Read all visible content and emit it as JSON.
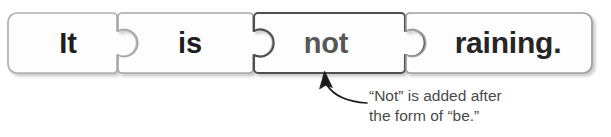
{
  "diagram": {
    "type": "jigsaw-sentence-breakdown",
    "sentence": "It is not raining.",
    "pieces": [
      {
        "id": "piece-it",
        "label": "It",
        "highlighted": false,
        "text_color": "#1e1e1e",
        "border_color": "#b0b0b0",
        "left_edge": "flat",
        "right_edge": "knob"
      },
      {
        "id": "piece-is",
        "label": "is",
        "highlighted": false,
        "text_color": "#1e1e1e",
        "border_color": "#a8a8a8",
        "left_edge": "socket",
        "right_edge": "knob"
      },
      {
        "id": "piece-not",
        "label": "not",
        "highlighted": true,
        "text_color": "#575757",
        "border_color": "#4f4f4f",
        "left_edge": "socket",
        "right_edge": "knob"
      },
      {
        "id": "piece-raining",
        "label": "raining.",
        "highlighted": false,
        "text_color": "#262626",
        "border_color": "#9e9e9e",
        "left_edge": "socket",
        "right_edge": "flat"
      }
    ]
  },
  "callout": {
    "target_piece": "piece-not",
    "lines": [
      "“Not” is added after",
      "the form of “be.”"
    ],
    "text_color": "#4a4a4a",
    "arrow_color": "#1c1c1c"
  },
  "colors": {
    "background": "#ffffff",
    "piece_fill": "#fdfdfd",
    "shadow": "#d8d8d8"
  }
}
